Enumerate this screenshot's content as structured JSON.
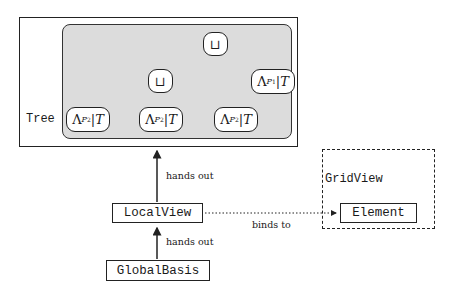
{
  "tree": {
    "label": "Tree",
    "root": {
      "symbol": "⊔"
    },
    "inner": {
      "symbol": "⊔"
    },
    "leaves": [
      {
        "lambda": "Λ",
        "sub": "P",
        "subsub": "2",
        "restrict": "|T"
      },
      {
        "lambda": "Λ",
        "sub": "P",
        "subsub": "2",
        "restrict": "|T"
      },
      {
        "lambda": "Λ",
        "sub": "P",
        "subsub": "2",
        "restrict": "|T"
      },
      {
        "lambda": "Λ",
        "sub": "P",
        "subsub": "1",
        "restrict": "|T"
      }
    ]
  },
  "gridview": {
    "label": "GridView",
    "element": "Element"
  },
  "localview": {
    "label": "LocalView"
  },
  "globalbasis": {
    "label": "GlobalBasis"
  },
  "edges": {
    "localview_to_tree": "hands out",
    "globalbasis_to_localview": "hands out",
    "localview_to_element": "binds to"
  }
}
